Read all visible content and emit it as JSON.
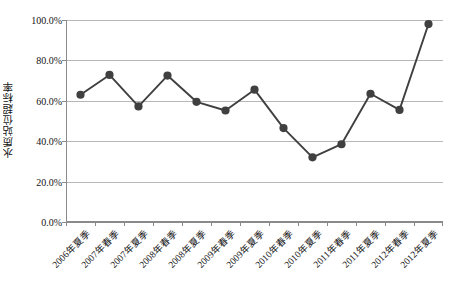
{
  "chart_data": {
    "type": "line",
    "title": "",
    "xlabel": "",
    "ylabel": "水质站位超标率",
    "ylim": [
      0,
      100
    ],
    "yticks": [
      0,
      20,
      40,
      60,
      80,
      100
    ],
    "ytick_labels": [
      "0.0%",
      "20.0%",
      "40.0%",
      "60.0%",
      "80.0%",
      "100.0%"
    ],
    "grid": true,
    "legend": "none",
    "unit": "%",
    "marker": "circle",
    "series_color": "#404040",
    "grid_color": "#b7b7b7",
    "axis_color": "#8a8a8a",
    "categories": [
      "2006年夏季",
      "2007年春季",
      "2007年夏季",
      "2008年春季",
      "2008年夏季",
      "2009年春季",
      "2009年夏季",
      "2010年春季",
      "2010年夏季",
      "2011年春季",
      "2011年夏季",
      "2012年春季",
      "2012年夏季"
    ],
    "series": [
      {
        "name": "水质站位超标率",
        "values": [
          63.0,
          72.8,
          57.2,
          72.5,
          59.5,
          55.2,
          65.5,
          46.5,
          32.0,
          38.5,
          63.5,
          55.5,
          98.0
        ]
      }
    ]
  }
}
